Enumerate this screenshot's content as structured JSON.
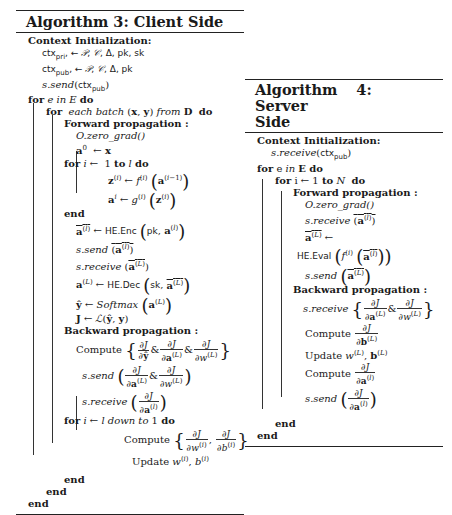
{
  "algorithm3": {
    "title": "Algorithm 3: Client Side",
    "context_init_label": "Context Initialization:",
    "ctx_pri_line": "ctx_pri, ← 𝒫, 𝒞, Δ, pk, sk",
    "ctx_pub_line": "ctx_pub, ← 𝒫, 𝒞, Δ, pk",
    "send_ctx": "s.send(ctx_pub)",
    "outer_for": "for e in E do",
    "batch_for": "for each batch (x, y) from D do",
    "forward_label": "Forward propagation :",
    "zero_grad": "O.zero_grad()",
    "a0_assign": "a⁰ ← x",
    "layer_for": "for i ← 1 to l do",
    "z_assign": "z⁽ⁱ⁾ ← f⁽ⁱ⁾ (a⁽ⁱ⁻¹⁾)",
    "a_assign": "aⁱ ← g⁽ⁱ⁾ (z⁽ⁱ⁾)",
    "end_layer": "end",
    "enc_line": "a⁽ˡ⁾ ← HE.Enc (pk, a⁽ˡ⁾)",
    "send_enc": "s.send (a⁽ˡ⁾)",
    "receive_enc": "s.receive (a⁽ᴸ⁾)",
    "dec_line": "a⁽ᴸ⁾ ← HE.Dec (sk, a⁽ᴸ⁾)",
    "softmax_line": "ŷ ← Softmax (a⁽ᴸ⁾)",
    "loss_line": "J ← ℒ(ŷ, y)",
    "backward_label": "Backward propagation :",
    "compute_grads": "Compute { ∂J/∂ŷ & ∂J/∂a⁽ᴸ⁾ & ∂J/∂w⁽ᴸ⁾ }",
    "send_grads": "s.send ( ∂J/∂a⁽ᴸ⁾ & ∂J/∂w⁽ᴸ⁾ )",
    "receive_grad": "s.receive ( ∂J/∂a⁽ˡ⁾ )",
    "down_for": "for i ← l down to 1 do",
    "compute_layer": "Compute { ∂J/∂w⁽ⁱ⁾, ∂J/∂b⁽ⁱ⁾ }",
    "update_layer": "Update w⁽ⁱ⁾, b⁽ⁱ⁾",
    "end_down": "end",
    "end_batch": "end",
    "end_outer": "end"
  },
  "algorithm4": {
    "title_part1": "Algorithm 4: Server",
    "title_part2": "Side",
    "context_init_label": "Context Initialization:",
    "receive_ctx": "s.receive(ctx_pub)",
    "outer_for": "for e in E do",
    "layer_for": "for i ← 1 to N do",
    "forward_label": "Forward propagation :",
    "zero_grad": "O.zero_grad()",
    "receive_enc": "s.receive (a⁽ˡ⁾)",
    "aL_assign": "a⁽ᴸ⁾ ←",
    "eval_line": "HE.Eval (f⁽ⁱ⁾ (a⁽ˡ⁾))",
    "send_enc": "s.send (a⁽ᴸ⁾)",
    "backward_label": "Backward propagation :",
    "receive_grads": "s.receive { ∂J/∂a⁽ᴸ⁾ & ∂J/∂w⁽ᴸ⁾ }",
    "compute_b": "Compute ∂J/∂b⁽ᴸ⁾",
    "update_wb": "Update w⁽ᴸ⁾, b⁽ᴸ⁾",
    "compute_a": "Compute ∂J/∂a⁽ˡ⁾",
    "send_grad": "s.send ( ∂J/∂a⁽ˡ⁾ )",
    "end_layer": "end",
    "end_outer": "end"
  }
}
